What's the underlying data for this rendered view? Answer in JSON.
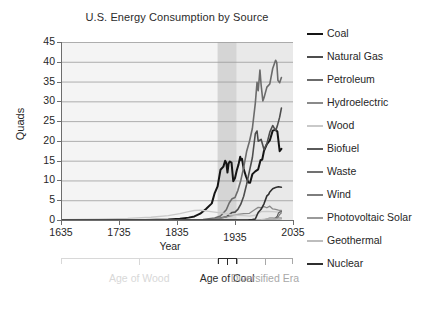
{
  "chart_data": {
    "type": "line",
    "title": "U.S. Energy Consumption by Source",
    "xlabel": "Year",
    "ylabel": "Quads",
    "xlim": [
      1635,
      2035
    ],
    "ylim": [
      0,
      45
    ],
    "xticks": [
      1635,
      1735,
      1835,
      1935,
      2035
    ],
    "yticks": [
      0,
      5,
      10,
      15,
      20,
      25,
      30,
      35,
      40,
      45
    ],
    "grid": "horizontal",
    "legend_position": "right",
    "bands": [
      {
        "name": "Age of Wood",
        "from": 1635,
        "to": 1905,
        "color": "#f4f4f4"
      },
      {
        "name": "Age of Coal",
        "from": 1905,
        "to": 1938,
        "color": "#d5d5d5"
      },
      {
        "name": "Diversified Era",
        "from": 1938,
        "to": 2035,
        "color": "#e9e9e9"
      }
    ],
    "eras": [
      {
        "label": "Age of Wood",
        "from": 1635,
        "to": 1905,
        "color": "#d8d8d8"
      },
      {
        "label": "Age of Coal",
        "from": 1905,
        "to": 1938,
        "color": "#2b2b2b"
      },
      {
        "label": "Diversified Era",
        "from": 1938,
        "to": 2035,
        "color": "#a8a8a8"
      }
    ],
    "series": [
      {
        "name": "Coal",
        "color": "#151515",
        "width": 2.0,
        "x": [
          1635,
          1780,
          1820,
          1840,
          1855,
          1865,
          1875,
          1885,
          1895,
          1900,
          1905,
          1910,
          1915,
          1918,
          1920,
          1922,
          1924,
          1926,
          1929,
          1932,
          1935,
          1938,
          1941,
          1944,
          1945,
          1947,
          1950,
          1954,
          1958,
          1961,
          1965,
          1970,
          1975,
          1979,
          1982,
          1985,
          1990,
          1995,
          2000,
          2005,
          2008,
          2012,
          2015
        ],
        "y": [
          0,
          0,
          0.1,
          0.3,
          0.6,
          0.9,
          1.6,
          2.8,
          4.2,
          6.8,
          8.5,
          12.7,
          13.5,
          15.0,
          14.5,
          12.0,
          14.3,
          14.8,
          14.5,
          9.8,
          10.6,
          12.5,
          14.0,
          16.0,
          15.2,
          15.5,
          12.9,
          11.0,
          9.5,
          9.4,
          11.6,
          12.3,
          12.8,
          15.1,
          15.3,
          17.5,
          19.2,
          20.1,
          22.6,
          22.8,
          22.4,
          17.4,
          18.0
        ]
      },
      {
        "name": "Natural Gas",
        "color": "#4d4d4d",
        "width": 1.6,
        "x": [
          1635,
          1880,
          1890,
          1900,
          1910,
          1920,
          1930,
          1935,
          1940,
          1945,
          1950,
          1955,
          1960,
          1965,
          1970,
          1973,
          1975,
          1980,
          1985,
          1990,
          1995,
          2000,
          2005,
          2008,
          2012,
          2015
        ],
        "y": [
          0,
          0,
          0.1,
          0.25,
          0.5,
          0.8,
          1.9,
          2.0,
          2.7,
          4.0,
          6.0,
          9.0,
          12.4,
          15.8,
          21.8,
          22.5,
          19.9,
          20.4,
          17.8,
          19.3,
          22.2,
          23.9,
          22.6,
          23.8,
          26.0,
          28.3
        ]
      },
      {
        "name": "Petroleum",
        "color": "#6b6b6b",
        "width": 1.6,
        "x": [
          1635,
          1860,
          1870,
          1880,
          1890,
          1900,
          1910,
          1920,
          1925,
          1930,
          1935,
          1940,
          1945,
          1950,
          1955,
          1960,
          1965,
          1970,
          1973,
          1975,
          1978,
          1980,
          1983,
          1985,
          1990,
          1995,
          2000,
          2005,
          2007,
          2009,
          2012,
          2015
        ],
        "y": [
          0,
          0,
          0.05,
          0.1,
          0.3,
          0.5,
          1.0,
          2.6,
          4.3,
          5.4,
          5.7,
          7.5,
          10.0,
          13.3,
          17.3,
          19.9,
          23.2,
          29.5,
          34.8,
          32.7,
          37.9,
          34.2,
          30.1,
          30.9,
          33.6,
          34.4,
          38.3,
          40.4,
          39.8,
          35.3,
          34.7,
          36.0
        ]
      },
      {
        "name": "Hydroelectric",
        "color": "#8a8a8a",
        "width": 1.3,
        "x": [
          1635,
          1880,
          1890,
          1900,
          1910,
          1920,
          1930,
          1940,
          1950,
          1960,
          1970,
          1975,
          1980,
          1985,
          1990,
          1995,
          2000,
          2005,
          2010,
          2015
        ],
        "y": [
          0,
          0,
          0.05,
          0.25,
          0.5,
          0.8,
          1.1,
          1.4,
          1.6,
          1.7,
          2.7,
          3.2,
          3.1,
          3.4,
          3.1,
          3.5,
          2.8,
          2.7,
          2.5,
          2.4
        ]
      },
      {
        "name": "Wood",
        "color": "#c9c9c9",
        "width": 1.3,
        "x": [
          1635,
          1700,
          1750,
          1790,
          1820,
          1840,
          1855,
          1865,
          1875,
          1880,
          1890,
          1900,
          1910,
          1920,
          1930,
          1940,
          1950,
          1960,
          1970,
          1980,
          1990,
          2000,
          2010,
          2015
        ],
        "y": [
          0.1,
          0.2,
          0.4,
          0.7,
          1.1,
          1.6,
          2.1,
          2.4,
          2.5,
          2.4,
          2.2,
          2.0,
          1.8,
          1.6,
          1.3,
          1.2,
          1.1,
          1.0,
          1.2,
          2.1,
          2.2,
          2.1,
          2.0,
          2.1
        ]
      },
      {
        "name": "Biofuel",
        "color": "#5a5a5a",
        "width": 1.2,
        "x": [
          1635,
          1980,
          1985,
          1990,
          1995,
          2000,
          2005,
          2008,
          2010,
          2012,
          2015
        ],
        "y": [
          0,
          0,
          0.05,
          0.1,
          0.2,
          0.25,
          0.5,
          1.0,
          1.8,
          2.0,
          2.1
        ]
      },
      {
        "name": "Waste",
        "color": "#717171",
        "width": 1.2,
        "x": [
          1635,
          1985,
          1990,
          1995,
          2000,
          2005,
          2010,
          2015
        ],
        "y": [
          0,
          0,
          0.3,
          0.5,
          0.5,
          0.4,
          0.5,
          0.5
        ]
      },
      {
        "name": "Wind",
        "color": "#7d7d7d",
        "width": 1.2,
        "x": [
          1635,
          1985,
          1990,
          1995,
          2000,
          2005,
          2008,
          2010,
          2012,
          2015
        ],
        "y": [
          0,
          0,
          0.03,
          0.03,
          0.06,
          0.18,
          0.5,
          0.9,
          1.4,
          1.8
        ]
      },
      {
        "name": "Photovoltaic Solar",
        "color": "#9a9a9a",
        "width": 1.2,
        "x": [
          1635,
          1990,
          1995,
          2000,
          2005,
          2010,
          2012,
          2015
        ],
        "y": [
          0,
          0,
          0.06,
          0.06,
          0.06,
          0.1,
          0.2,
          0.4
        ]
      },
      {
        "name": "Geothermal",
        "color": "#bdbdbd",
        "width": 1.2,
        "x": [
          1635,
          1960,
          1970,
          1980,
          1990,
          2000,
          2010,
          2015
        ],
        "y": [
          0,
          0,
          0.03,
          0.1,
          0.3,
          0.3,
          0.2,
          0.2
        ]
      },
      {
        "name": "Nuclear",
        "color": "#2f2f2f",
        "width": 1.6,
        "x": [
          1635,
          1957,
          1960,
          1965,
          1970,
          1975,
          1980,
          1985,
          1990,
          1993,
          1995,
          2000,
          2005,
          2010,
          2015
        ],
        "y": [
          0,
          0,
          0.05,
          0.1,
          0.24,
          1.9,
          2.7,
          4.1,
          6.1,
          6.5,
          7.1,
          7.9,
          8.2,
          8.4,
          8.3
        ]
      }
    ]
  },
  "legend": {
    "items": [
      {
        "label": "Coal",
        "color": "#151515"
      },
      {
        "label": "Natural Gas",
        "color": "#4d4d4d"
      },
      {
        "label": "Petroleum",
        "color": "#6b6b6b"
      },
      {
        "label": "Hydroelectric",
        "color": "#8a8a8a"
      },
      {
        "label": "Wood",
        "color": "#c9c9c9"
      },
      {
        "label": "Biofuel",
        "color": "#5a5a5a"
      },
      {
        "label": "Waste",
        "color": "#717171"
      },
      {
        "label": "Wind",
        "color": "#7d7d7d"
      },
      {
        "label": "Photovoltaic Solar",
        "color": "#9a9a9a"
      },
      {
        "label": "Geothermal",
        "color": "#bdbdbd"
      },
      {
        "label": "Nuclear",
        "color": "#2f2f2f"
      }
    ]
  }
}
